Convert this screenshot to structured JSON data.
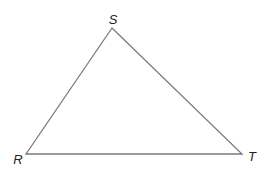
{
  "diagram": {
    "type": "triangle",
    "stroke_color": "#7a7a7a",
    "label_color": "#222222",
    "vertices": [
      {
        "name": "S",
        "x": 112,
        "y": 28,
        "label_x": 113,
        "label_y": 24
      },
      {
        "name": "R",
        "x": 26,
        "y": 154,
        "label_x": 18,
        "label_y": 164
      },
      {
        "name": "T",
        "x": 242,
        "y": 154,
        "label_x": 252,
        "label_y": 161
      }
    ],
    "labels": {
      "s": "S",
      "r": "R",
      "t": "T"
    }
  }
}
